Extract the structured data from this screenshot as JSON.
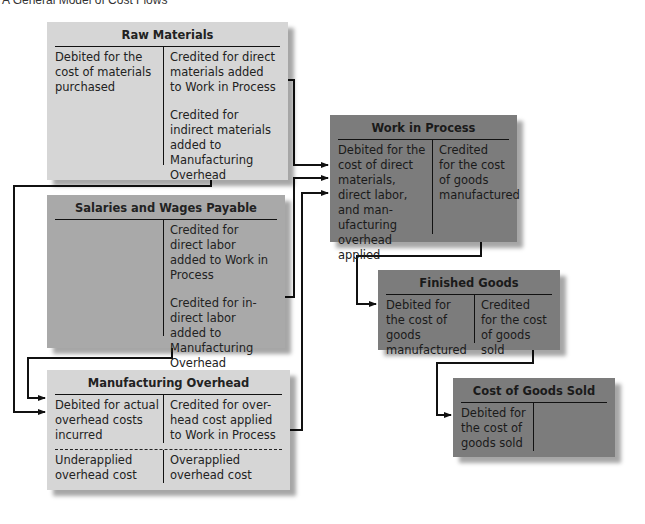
{
  "title": "A General Model of Cost Flows",
  "accounts": {
    "raw_materials": {
      "name": "Raw Materials",
      "debit": [
        "Debited for the cost of materials purchased"
      ],
      "credit": [
        "Credited for direct materials added to Work in Process",
        "Credited for indirect materials added to Manufacturing Overhead"
      ],
      "shade": "light"
    },
    "salaries_wages": {
      "name": "Salaries and Wages Payable",
      "debit": [],
      "credit": [
        "Credited for direct labor added to Work in Process",
        "Credited for in-direct labor added to Manufacturing Overhead"
      ],
      "shade": "mid"
    },
    "mfg_overhead": {
      "name": "Manufacturing Overhead",
      "debit": [
        "Debited for actual overhead costs incurred"
      ],
      "credit": [
        "Credited for over-head cost applied to Work in Process"
      ],
      "debit_bottom": "Underapplied overhead cost",
      "credit_bottom": "Overapplied overhead cost",
      "shade": "light"
    },
    "work_in_process": {
      "name": "Work in Process",
      "debit": [
        "Debited for the cost of direct materials, direct labor, and man-ufacturing overhead applied"
      ],
      "credit": [
        "Credited for the cost of goods manufactured"
      ],
      "shade": "dark"
    },
    "finished_goods": {
      "name": "Finished Goods",
      "debit": [
        "Debited for the cost of goods manufactured"
      ],
      "credit": [
        "Credited for the cost of goods sold"
      ],
      "shade": "dark"
    },
    "cogs": {
      "name": "Cost of Goods Sold",
      "debit": [
        "Debited for the cost of goods sold"
      ],
      "credit": [],
      "shade": "dark"
    }
  },
  "flows": [
    {
      "from": "Raw Materials (credit: direct materials)",
      "to": "Work in Process (debit)"
    },
    {
      "from": "Raw Materials (credit: indirect materials)",
      "to": "Manufacturing Overhead (debit)"
    },
    {
      "from": "Salaries and Wages Payable (credit: direct labor)",
      "to": "Work in Process (debit)"
    },
    {
      "from": "Salaries and Wages Payable (credit: indirect labor)",
      "to": "Manufacturing Overhead (debit)"
    },
    {
      "from": "Manufacturing Overhead (credit: applied overhead)",
      "to": "Work in Process (debit)"
    },
    {
      "from": "Work in Process (credit)",
      "to": "Finished Goods (debit)"
    },
    {
      "from": "Finished Goods (credit)",
      "to": "Cost of Goods Sold (debit)"
    }
  ],
  "colors": {
    "light": "#d6d6d6",
    "mid": "#a9a9a9",
    "dark": "#7c7c7c",
    "line": "#111111"
  }
}
